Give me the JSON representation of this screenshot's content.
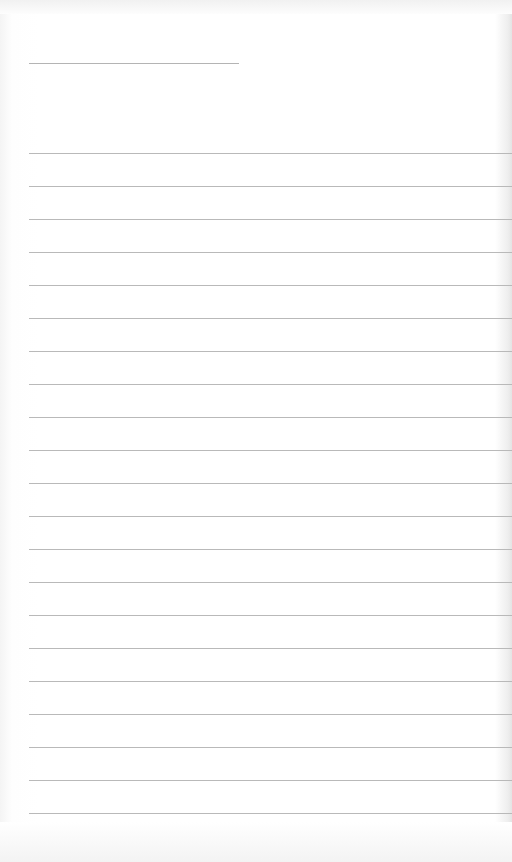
{
  "document": {
    "type": "lined-paper",
    "header_line": {
      "top": 63,
      "left": 29,
      "width": 210
    },
    "rules": {
      "count": 21,
      "first_top": 153,
      "spacing": 33,
      "left": 29
    },
    "colors": {
      "paper": "#ffffff",
      "rule": "#b9b9b9"
    }
  }
}
